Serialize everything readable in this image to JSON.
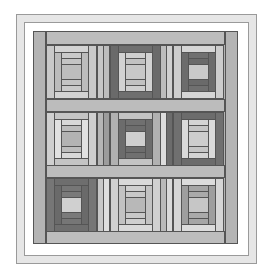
{
  "quilt": {
    "name": "Log cabin courthouse steps quilt",
    "colors": {
      "border": "#b4b4b4",
      "sashing_horizontal": "#bcbcbc",
      "sashing_vertical": "#c6c6c6",
      "frame_band": "#e6e6e6",
      "frame_line": "#9a9a9a",
      "seam": "#555555"
    },
    "grid": {
      "rows": 3,
      "cols": 3,
      "col_x": [
        46,
        110,
        173
      ],
      "row_y": [
        45,
        112,
        178
      ],
      "block_w": 51,
      "block_h": 54
    },
    "blocks": [
      {
        "row": 0,
        "col": 0,
        "tone": "light",
        "colors": [
          "#c9c9c9",
          "#d3d3d3",
          "#bcbcbc",
          "#cacaca",
          "#c4c4c4",
          "#bdbdbd"
        ]
      },
      {
        "row": 0,
        "col": 1,
        "tone": "dark-outer",
        "colors": [
          "#6a6a6a",
          "#6f6f6f",
          "#d2d2d2",
          "#cfcfcf",
          "#c2c2c2",
          "#c8c8c8"
        ]
      },
      {
        "row": 0,
        "col": 2,
        "tone": "dark-middle",
        "colors": [
          "#cdcdcd",
          "#d6d6d6",
          "#6c6c6c",
          "#707070",
          "#6a6a6a",
          "#c9c9c9"
        ]
      },
      {
        "row": 1,
        "col": 0,
        "tone": "light",
        "colors": [
          "#cfcfcf",
          "#c4c4c4",
          "#e1e1e1",
          "#d8d8d8",
          "#bdbdbd",
          "#b3b3b3"
        ]
      },
      {
        "row": 1,
        "col": 1,
        "tone": "dark-middle",
        "colors": [
          "#b1b1b1",
          "#c3c3c3",
          "#6c6c6c",
          "#707070",
          "#6d6d6d",
          "#cfcfcf"
        ]
      },
      {
        "row": 1,
        "col": 2,
        "tone": "dark-outer",
        "colors": [
          "#707070",
          "#6c6c6c",
          "#dadada",
          "#d4d4d4",
          "#c5c5c5",
          "#cdcdcd"
        ]
      },
      {
        "row": 2,
        "col": 0,
        "tone": "darkest",
        "colors": [
          "#767676",
          "#6e6e6e",
          "#6a6a6a",
          "#767676",
          "#7a7a7a",
          "#d0d0d0"
        ]
      },
      {
        "row": 2,
        "col": 1,
        "tone": "light",
        "colors": [
          "#d0d0d0",
          "#d9d9d9",
          "#c2c2c2",
          "#cfcfcf",
          "#c8c8c8",
          "#b8b8b8"
        ]
      },
      {
        "row": 2,
        "col": 2,
        "tone": "medium",
        "colors": [
          "#d6d6d6",
          "#dcdcdc",
          "#9e9e9e",
          "#a6a6a6",
          "#aaaaaa",
          "#c6c6c6"
        ]
      }
    ],
    "sashing_vertical": [
      {
        "row": 0,
        "x": 97,
        "colors": [
          "#c6c6c6",
          "#bdbdbd"
        ]
      },
      {
        "row": 0,
        "x": 160,
        "colors": [
          "#bdbdbd",
          "#d0d0d0"
        ]
      },
      {
        "row": 1,
        "x": 97,
        "colors": [
          "#b6b6b6",
          "#9c9c9c"
        ]
      },
      {
        "row": 1,
        "x": 160,
        "colors": [
          "#dcdcdc",
          "#6c6c6c"
        ]
      },
      {
        "row": 2,
        "x": 97,
        "colors": [
          "#c8c8c8",
          "#dedede"
        ]
      },
      {
        "row": 2,
        "x": 160,
        "colors": [
          "#bababa",
          "#dadada"
        ]
      }
    ]
  }
}
